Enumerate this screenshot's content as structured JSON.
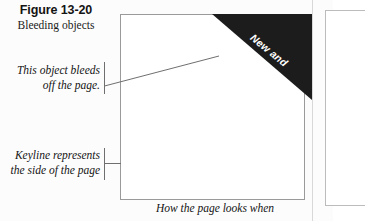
{
  "figure": {
    "number": "Figure 13-20",
    "subtitle": "Bleeding objects",
    "caption": "How the page looks when"
  },
  "banner": {
    "line_1": "New and",
    "line_2": "Improved",
    "fill_color": "#1c1c1c",
    "text_color": "#ffffff"
  },
  "callouts": {
    "bleed": {
      "line_1": "This object bleeds",
      "line_2": "off the page."
    },
    "keyline": {
      "line_1": "Keyline represents",
      "line_2": "the side of the page"
    }
  },
  "colors": {
    "keyline_stroke": "#9a9a9a",
    "leader_stroke": "#6f6f6f",
    "page_fill": "#ffffff",
    "background": "#fcfcfc"
  }
}
